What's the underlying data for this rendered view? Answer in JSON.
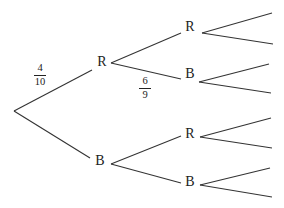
{
  "diagram": {
    "type": "probability-tree",
    "colors": {
      "line": "#333333",
      "text": "#222222",
      "background": "#ffffff"
    },
    "nodes": {
      "level1": [
        {
          "id": "R",
          "label": "R",
          "x": 102,
          "y": 62
        },
        {
          "id": "B",
          "label": "B",
          "x": 100,
          "y": 161
        }
      ],
      "level2": [
        {
          "id": "RR",
          "label": "R",
          "x": 190,
          "y": 27
        },
        {
          "id": "RB",
          "label": "B",
          "x": 190,
          "y": 74
        },
        {
          "id": "BR",
          "label": "R",
          "x": 190,
          "y": 134
        },
        {
          "id": "BB",
          "label": "B",
          "x": 190,
          "y": 182
        }
      ]
    },
    "probabilities": {
      "root_to_R": {
        "numerator": "4",
        "denominator": "10",
        "x": 40,
        "y": 75
      },
      "R_to_B": {
        "numerator": "6",
        "denominator": "9",
        "x": 145,
        "y": 88
      }
    },
    "edges": [
      {
        "from": "root",
        "to": "R",
        "x1": 14,
        "y1": 111,
        "x2": 92,
        "y2": 70
      },
      {
        "from": "root",
        "to": "B",
        "x1": 14,
        "y1": 111,
        "x2": 90,
        "y2": 158
      },
      {
        "from": "R",
        "to": "RR",
        "x1": 111,
        "y1": 63,
        "x2": 181,
        "y2": 33
      },
      {
        "from": "R",
        "to": "RB",
        "x1": 111,
        "y1": 63,
        "x2": 181,
        "y2": 79
      },
      {
        "from": "B",
        "to": "BR",
        "x1": 111,
        "y1": 164,
        "x2": 181,
        "y2": 136
      },
      {
        "from": "B",
        "to": "BB",
        "x1": 111,
        "y1": 164,
        "x2": 181,
        "y2": 183
      },
      {
        "from": "RR",
        "to": "leaf1",
        "x1": 202,
        "y1": 33,
        "x2": 272,
        "y2": 13
      },
      {
        "from": "RR",
        "to": "leaf2",
        "x1": 202,
        "y1": 33,
        "x2": 273,
        "y2": 44
      },
      {
        "from": "RB",
        "to": "leaf3",
        "x1": 199,
        "y1": 82,
        "x2": 269,
        "y2": 64
      },
      {
        "from": "RB",
        "to": "leaf4",
        "x1": 199,
        "y1": 82,
        "x2": 271,
        "y2": 93
      },
      {
        "from": "BR",
        "to": "leaf5",
        "x1": 200,
        "y1": 137,
        "x2": 271,
        "y2": 118
      },
      {
        "from": "BR",
        "to": "leaf6",
        "x1": 200,
        "y1": 137,
        "x2": 272,
        "y2": 148
      },
      {
        "from": "BB",
        "to": "leaf7",
        "x1": 200,
        "y1": 185,
        "x2": 270,
        "y2": 168
      },
      {
        "from": "BB",
        "to": "leaf8",
        "x1": 200,
        "y1": 185,
        "x2": 272,
        "y2": 197
      }
    ]
  }
}
